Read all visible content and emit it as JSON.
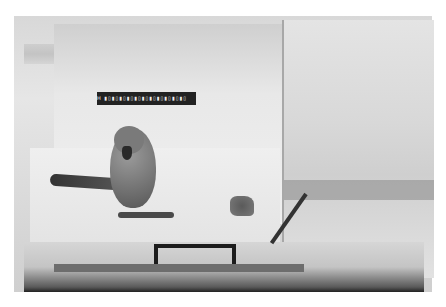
{
  "image": {
    "description": "Grayscale photograph of a parrot standing on the floor of a transparent acrylic test chamber with a scale ruler affixed to the back wall",
    "subjects": [
      "parrot",
      "acrylic chamber",
      "scale ruler",
      "food item",
      "cable",
      "base clamp"
    ],
    "ruler": {
      "label": "scale-bar"
    }
  }
}
